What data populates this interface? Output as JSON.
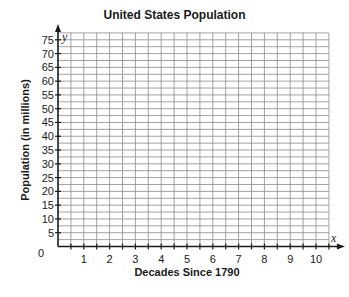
{
  "chart_data": {
    "type": "scatter",
    "title": "United States Population",
    "xlabel": "Decades Since 1790",
    "ylabel": "Population (in millions)",
    "x_axis_var": "x",
    "y_axis_var": "y",
    "origin_label": "0",
    "x_ticks": [
      1,
      2,
      3,
      4,
      5,
      6,
      7,
      8,
      9,
      10
    ],
    "y_ticks": [
      5,
      10,
      15,
      20,
      25,
      30,
      35,
      40,
      45,
      50,
      55,
      60,
      65,
      70,
      75
    ],
    "xlim": [
      0,
      10.5
    ],
    "ylim": [
      0,
      77.5
    ],
    "x_grid_step": 0.5,
    "y_grid_step": 5,
    "grid": true,
    "legend": null,
    "series": [],
    "note": "Blank coordinate grid; no data points plotted."
  },
  "colors": {
    "grid": "#8a8a8a",
    "axis": "#1a1a1a",
    "text": "#1a1a1a"
  }
}
